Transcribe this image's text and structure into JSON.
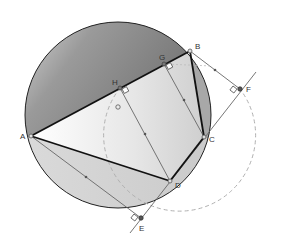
{
  "diagram": {
    "type": "geometry-construction",
    "circle": {
      "center": "O",
      "label": "O"
    },
    "points": [
      {
        "id": "A",
        "label": "A"
      },
      {
        "id": "B",
        "label": "B"
      },
      {
        "id": "C",
        "label": "C"
      },
      {
        "id": "D",
        "label": "D"
      },
      {
        "id": "E",
        "label": "E"
      },
      {
        "id": "F",
        "label": "F"
      },
      {
        "id": "G",
        "label": "G"
      },
      {
        "id": "H",
        "label": "H"
      }
    ],
    "polygon": [
      "A",
      "B",
      "C",
      "D"
    ],
    "perpendiculars": [
      "H",
      "G",
      "E",
      "F"
    ],
    "colors": {
      "stroke": "#111111",
      "thin": "#555555",
      "dashed": "#aaaaaa",
      "fill_dark": "#6e6e6e",
      "fill_light": "#e8e8e8"
    }
  }
}
